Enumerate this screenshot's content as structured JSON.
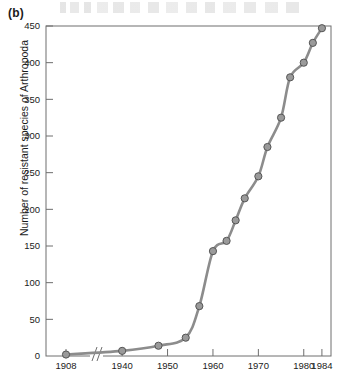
{
  "figure": {
    "panel_label": "(b)",
    "ylabel": "Number of resistant species of Arthropoda",
    "xlabel": "",
    "line_color": "#8c8c8c",
    "marker_fill": "#9a9a9a",
    "marker_stroke": "#555555",
    "axis_color": "#6e6e6e",
    "axis_break": "1908-1940"
  },
  "chart_data": {
    "type": "line",
    "title": "",
    "xlabel": "",
    "ylabel": "Number of resistant species of Arthropoda",
    "xlim": [
      1905,
      1986
    ],
    "ylim": [
      0,
      450
    ],
    "grid": false,
    "legend": null,
    "axis_break": {
      "after": 1912,
      "before": 1936,
      "style": "double-slash"
    },
    "x_ticks": [
      1908,
      1940,
      1950,
      1960,
      1970,
      1980,
      1984
    ],
    "x_tick_labels": [
      "1908",
      "1940",
      "1950",
      "1960",
      "1970",
      "1980",
      "1984"
    ],
    "y_ticks": [
      0,
      50,
      100,
      150,
      200,
      250,
      300,
      350,
      400,
      450
    ],
    "y_tick_labels": [
      "0",
      "50",
      "100",
      "150",
      "200",
      "250",
      "300",
      "350",
      "400",
      "450"
    ],
    "series": [
      {
        "name": "Resistant arthropod species",
        "marker": "filled-circle",
        "x": [
          1908,
          1940,
          1948,
          1954,
          1957,
          1960,
          1963,
          1965,
          1967,
          1970,
          1972,
          1975,
          1977,
          1980,
          1982,
          1984
        ],
        "values": [
          2,
          7,
          14,
          25,
          68,
          143,
          157,
          185,
          215,
          245,
          285,
          325,
          380,
          400,
          427,
          447
        ]
      }
    ]
  }
}
